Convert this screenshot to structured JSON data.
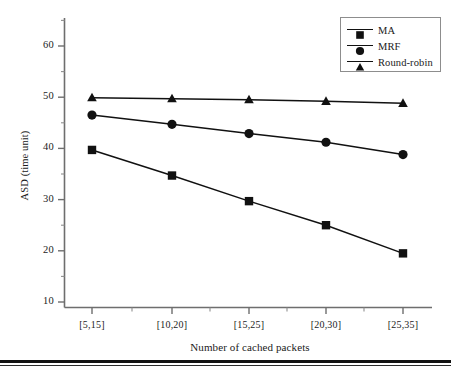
{
  "chart_data": {
    "type": "line",
    "title": "",
    "xlabel": "Number of cached packets",
    "ylabel": "ASD (time unit)",
    "categories": [
      "[5,15]",
      "[10,20]",
      "[15,25]",
      "[20,30]",
      "[25,35]"
    ],
    "ylim": [
      10,
      63
    ],
    "yticks": [
      10,
      20,
      30,
      40,
      50,
      60
    ],
    "ytick_labels": [
      "10",
      "20",
      "30",
      "40",
      "50",
      "60"
    ],
    "yminor_ticks": [
      15,
      25,
      35,
      45,
      55
    ],
    "grid": false,
    "legend_position": "top-right",
    "series": [
      {
        "name": "MA",
        "marker": "square",
        "color": "#111111",
        "values": [
          39.7,
          34.7,
          29.7,
          25.0,
          19.5
        ]
      },
      {
        "name": "MRF",
        "marker": "circle",
        "color": "#111111",
        "values": [
          46.5,
          44.7,
          42.9,
          41.2,
          38.8
        ]
      },
      {
        "name": "Round-robin",
        "marker": "triangle",
        "color": "#111111",
        "values": [
          49.9,
          49.7,
          49.5,
          49.2,
          48.8
        ]
      }
    ]
  },
  "legend": {
    "entries": [
      {
        "label": "MA"
      },
      {
        "label": "MRF"
      },
      {
        "label": "Round-robin"
      }
    ]
  },
  "axes": {
    "y_label": "ASD (time unit)",
    "x_label": "Number of cached packets",
    "y_tick_0": "10",
    "y_tick_1": "20",
    "y_tick_2": "30",
    "y_tick_3": "40",
    "y_tick_4": "50",
    "y_tick_5": "60",
    "x_tick_0": "[5,15]",
    "x_tick_1": "[10,20]",
    "x_tick_2": "[15,25]",
    "x_tick_3": "[20,30]",
    "x_tick_4": "[25,35]"
  }
}
